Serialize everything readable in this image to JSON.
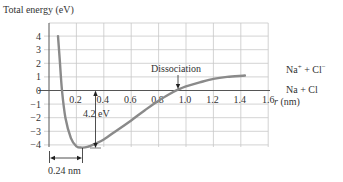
{
  "chart_data": {
    "type": "line",
    "title": "",
    "ylabel": "Total energy (eV)",
    "xlabel": "r (nm)",
    "xlim": [
      0,
      1.6
    ],
    "ylim": [
      -4,
      4
    ],
    "grid": true,
    "x_ticks": [
      "0.2",
      "0.4",
      "0.6",
      "0.8",
      "1.0",
      "1.2",
      "1.4",
      "1.6"
    ],
    "y_ticks": [
      "4",
      "3",
      "2",
      "1",
      "0",
      "−1",
      "−2",
      "−3",
      "−4"
    ],
    "series": [
      {
        "name": "NaCl total energy",
        "x": [
          0.066,
          0.08,
          0.095,
          0.12,
          0.16,
          0.2,
          0.24,
          0.28,
          0.34,
          0.4,
          0.5,
          0.6,
          0.7,
          0.8,
          0.9,
          0.95,
          1.0,
          1.1,
          1.2,
          1.3,
          1.43
        ],
        "y": [
          4.0,
          2.0,
          0.0,
          -2.0,
          -3.5,
          -4.1,
          -4.2,
          -4.15,
          -3.9,
          -3.6,
          -2.9,
          -2.2,
          -1.45,
          -0.75,
          -0.15,
          0.1,
          0.3,
          0.6,
          0.85,
          1.0,
          1.1
        ]
      }
    ],
    "annotations": [
      {
        "text": "Dissociation",
        "x": 0.94,
        "y": 0.05,
        "arrow": "down"
      },
      {
        "text": "4.2 eV",
        "x": 0.34,
        "from_y": 0,
        "to_y": -4.2,
        "arrow": "double-vertical"
      },
      {
        "text": "0.24 nm",
        "from_x": 0.0,
        "to_x": 0.24,
        "arrow": "double-horizontal"
      }
    ],
    "right_labels": [
      "Na⁺ + Cl⁻",
      "Na + Cl"
    ]
  },
  "labels": {
    "ylabel": "Total energy (eV)",
    "xunit_r": "r",
    "xunit": " (nm)",
    "dissociation": "Dissociation",
    "energy_gap": "4.2 eV",
    "distance": "0.24 nm",
    "ion_pair_na": "Na",
    "ion_pair_plus": "+",
    "ion_pair_mid": " + Cl",
    "ion_pair_minus": "−",
    "neutral_pair": "Na + Cl"
  },
  "ticks": {
    "x": [
      "0.2",
      "0.4",
      "0.6",
      "0.8",
      "1.0",
      "1.2",
      "1.4",
      "1.6"
    ],
    "y": [
      "4",
      "3",
      "2",
      "1",
      "0",
      "−1",
      "−2",
      "−3",
      "−4"
    ]
  }
}
